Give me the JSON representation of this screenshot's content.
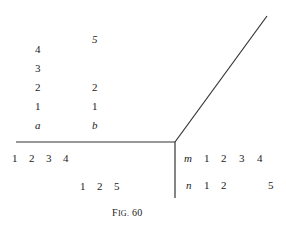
{
  "figure": {
    "caption_prefix": "F",
    "caption_smallcaps": "IG.",
    "caption_number": "60"
  },
  "column_a": {
    "header": "a",
    "values": [
      "1",
      "2",
      "3",
      "4"
    ]
  },
  "column_b": {
    "header": "b",
    "values": [
      "1",
      "2",
      "5"
    ]
  },
  "row_bottom_left_1": [
    "1",
    "2",
    "3",
    "4"
  ],
  "row_bottom_left_2": [
    "1",
    "2",
    "5"
  ],
  "row_m": {
    "header": "m",
    "values": [
      "1",
      "2",
      "3",
      "4"
    ]
  },
  "row_n": {
    "header": "n",
    "values": [
      "1",
      "2",
      "5"
    ]
  },
  "lines": {
    "color": "#333333",
    "horizontal": {
      "x1": 16,
      "y1": 142,
      "x2": 175,
      "y2": 142
    },
    "vertical": {
      "x1": 175,
      "y1": 142,
      "x2": 175,
      "y2": 198
    },
    "diagonal": {
      "x1": 175,
      "y1": 142,
      "x2": 267,
      "y2": 16
    }
  }
}
